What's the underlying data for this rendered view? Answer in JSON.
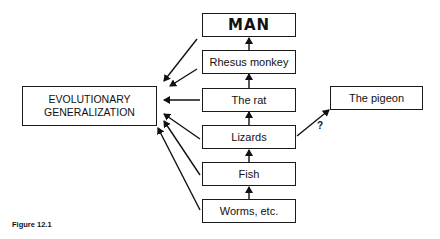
{
  "diagram": {
    "ladder": [
      {
        "id": "man",
        "label": "MAN"
      },
      {
        "id": "rhesus",
        "label": "Rhesus monkey"
      },
      {
        "id": "rat",
        "label": "The rat"
      },
      {
        "id": "lizards",
        "label": "Lizards"
      },
      {
        "id": "fish",
        "label": "Fish"
      },
      {
        "id": "worms",
        "label": "Worms, etc."
      }
    ],
    "generalization": {
      "line1": "EVOLUTIONARY",
      "line2": "GENERALIZATION"
    },
    "side_node": {
      "label": "The pigeon"
    },
    "side_edge_label": "?",
    "caption": "Figure 12.1",
    "edges": [
      {
        "from": "worms",
        "to": "fish"
      },
      {
        "from": "fish",
        "to": "lizards"
      },
      {
        "from": "lizards",
        "to": "rat"
      },
      {
        "from": "rat",
        "to": "rhesus"
      },
      {
        "from": "rhesus",
        "to": "man"
      },
      {
        "from": "lizards",
        "to": "pigeon",
        "label": "?"
      },
      {
        "from": "man",
        "to": "generalization"
      },
      {
        "from": "rhesus",
        "to": "generalization"
      },
      {
        "from": "rat",
        "to": "generalization"
      },
      {
        "from": "lizards",
        "to": "generalization"
      },
      {
        "from": "fish",
        "to": "generalization"
      },
      {
        "from": "worms",
        "to": "generalization"
      }
    ]
  }
}
